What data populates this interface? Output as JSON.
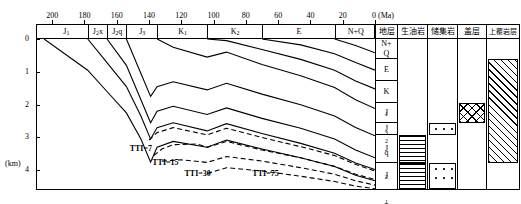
{
  "chart_data": {
    "type": "line",
    "xlabel": "Ma",
    "ylabel": "km",
    "xlim": [
      210,
      0
    ],
    "ylim": [
      0,
      4.6
    ],
    "x_axis": {
      "unit_label": "0 (Ma)",
      "unit_only": "(Ma)",
      "zero_label": "0",
      "ticks": [
        200,
        180,
        160,
        140,
        120,
        100,
        80,
        60,
        40,
        20,
        0
      ],
      "tick_labels": [
        "200",
        "180",
        "160",
        "140",
        "120",
        "100",
        "80",
        "60",
        "40",
        "20",
        "0"
      ],
      "direction": "decreasing-left-to-right"
    },
    "y_axis": {
      "unit_label": "(km)",
      "ticks": [
        0,
        1,
        2,
        3,
        4
      ],
      "tick_labels": [
        "0",
        "1",
        "2",
        "3",
        "4"
      ],
      "direction": "increasing-downward"
    },
    "grid": false,
    "legend": null,
    "top_stratigraphic_bar": [
      {
        "label": "J₁",
        "from_ma": 205,
        "to_ma": 178
      },
      {
        "label": "J₂x",
        "from_ma": 178,
        "to_ma": 166
      },
      {
        "label": "J₂q",
        "from_ma": 166,
        "to_ma": 154
      },
      {
        "label": "J₃",
        "from_ma": 154,
        "to_ma": 135
      },
      {
        "label": "K₁",
        "from_ma": 135,
        "to_ma": 104
      },
      {
        "label": "K₂",
        "from_ma": 104,
        "to_ma": 70
      },
      {
        "label": "E",
        "from_ma": 70,
        "to_ma": 25
      },
      {
        "label": "N+Q",
        "from_ma": 25,
        "to_ma": 0
      }
    ],
    "burial_curves": [
      {
        "name": "J₁-top",
        "points": [
          [
            205,
            0.0
          ],
          [
            178,
            0.95
          ],
          [
            166,
            1.6
          ],
          [
            154,
            2.25
          ],
          [
            145,
            3.05
          ],
          [
            139,
            3.75
          ],
          [
            135,
            3.3
          ],
          [
            125,
            3.12
          ],
          [
            104,
            3.3
          ],
          [
            92,
            3.08
          ],
          [
            70,
            3.35
          ],
          [
            46,
            3.62
          ],
          [
            25,
            3.88
          ],
          [
            12,
            4.15
          ],
          [
            0,
            4.32
          ]
        ]
      },
      {
        "name": "J₂x-top",
        "points": [
          [
            178,
            0.0
          ],
          [
            166,
            0.72
          ],
          [
            154,
            1.45
          ],
          [
            145,
            2.35
          ],
          [
            139,
            3.05
          ],
          [
            135,
            2.7
          ],
          [
            125,
            2.55
          ],
          [
            104,
            2.8
          ],
          [
            92,
            2.58
          ],
          [
            70,
            2.88
          ],
          [
            46,
            3.18
          ],
          [
            25,
            3.48
          ],
          [
            12,
            3.78
          ],
          [
            0,
            3.98
          ]
        ]
      },
      {
        "name": "J₂q-top",
        "points": [
          [
            166,
            0.0
          ],
          [
            154,
            0.8
          ],
          [
            145,
            1.85
          ],
          [
            139,
            2.55
          ],
          [
            135,
            2.2
          ],
          [
            125,
            2.05
          ],
          [
            104,
            2.3
          ],
          [
            92,
            2.1
          ],
          [
            70,
            2.42
          ],
          [
            46,
            2.72
          ],
          [
            25,
            3.05
          ],
          [
            12,
            3.38
          ],
          [
            0,
            3.62
          ]
        ]
      },
      {
        "name": "J₃-top",
        "points": [
          [
            154,
            0.0
          ],
          [
            145,
            1.05
          ],
          [
            139,
            1.75
          ],
          [
            135,
            1.45
          ],
          [
            125,
            1.3
          ],
          [
            104,
            1.55
          ],
          [
            92,
            1.35
          ],
          [
            70,
            1.68
          ],
          [
            46,
            2.0
          ],
          [
            25,
            2.35
          ],
          [
            12,
            2.7
          ],
          [
            0,
            2.95
          ]
        ]
      },
      {
        "name": "K₁-top",
        "points": [
          [
            135,
            0.0
          ],
          [
            125,
            0.25
          ],
          [
            104,
            0.55
          ],
          [
            92,
            0.4
          ],
          [
            70,
            0.78
          ],
          [
            46,
            1.12
          ],
          [
            25,
            1.48
          ],
          [
            12,
            1.85
          ],
          [
            0,
            2.12
          ]
        ]
      },
      {
        "name": "K₂-top",
        "points": [
          [
            104,
            0.0
          ],
          [
            92,
            0.05
          ],
          [
            70,
            0.32
          ],
          [
            46,
            0.62
          ],
          [
            25,
            0.95
          ],
          [
            12,
            1.28
          ],
          [
            0,
            1.52
          ]
        ]
      },
      {
        "name": "E-top",
        "points": [
          [
            70,
            0.0
          ],
          [
            46,
            0.18
          ],
          [
            25,
            0.45
          ],
          [
            12,
            0.72
          ],
          [
            0,
            0.95
          ]
        ]
      },
      {
        "name": "N+Q-top",
        "points": [
          [
            25,
            0.0
          ],
          [
            12,
            0.2
          ],
          [
            0,
            0.42
          ]
        ]
      }
    ],
    "tti_isolines": [
      {
        "label": "TTI=7",
        "value": 7,
        "label_ma": 152,
        "label_km": 3.2,
        "points": [
          [
            140,
            3.08
          ],
          [
            135,
            2.85
          ],
          [
            125,
            2.7
          ],
          [
            104,
            2.92
          ],
          [
            92,
            2.72
          ],
          [
            70,
            3.0
          ],
          [
            46,
            3.28
          ],
          [
            25,
            3.55
          ],
          [
            12,
            3.82
          ],
          [
            0,
            4.02
          ]
        ]
      },
      {
        "label": "TTI=15",
        "value": 15,
        "label_ma": 138,
        "label_km": 3.62,
        "points": [
          [
            137,
            3.55
          ],
          [
            132,
            3.35
          ],
          [
            125,
            3.22
          ],
          [
            110,
            3.2
          ],
          [
            104,
            3.3
          ],
          [
            92,
            3.12
          ],
          [
            70,
            3.38
          ],
          [
            46,
            3.62
          ],
          [
            25,
            3.88
          ],
          [
            12,
            4.12
          ],
          [
            0,
            4.28
          ]
        ]
      },
      {
        "label": "TTI=30",
        "value": 30,
        "label_ma": 118,
        "label_km": 3.95,
        "points": [
          [
            132,
            3.72
          ],
          [
            120,
            3.68
          ],
          [
            104,
            3.76
          ],
          [
            92,
            3.58
          ],
          [
            70,
            3.72
          ],
          [
            46,
            3.92
          ],
          [
            25,
            4.12
          ],
          [
            12,
            4.32
          ],
          [
            0,
            4.45
          ]
        ]
      },
      {
        "label": "TTI=75",
        "value": 75,
        "label_ma": 76,
        "label_km": 3.95,
        "points": [
          [
            104,
            4.1
          ],
          [
            92,
            3.92
          ],
          [
            70,
            4.02
          ],
          [
            46,
            4.18
          ],
          [
            25,
            4.34
          ],
          [
            12,
            4.48
          ],
          [
            0,
            4.56
          ]
        ]
      }
    ]
  },
  "right_panel": {
    "columns": [
      {
        "key": "strat",
        "label": "地层"
      },
      {
        "key": "source",
        "label": "生油岩"
      },
      {
        "key": "reservoir",
        "label": "储集岩"
      },
      {
        "key": "cap",
        "label": "盖层"
      },
      {
        "key": "overburden",
        "label": "上覆岩层"
      }
    ],
    "strat_rows": [
      {
        "label": "N+\nQ",
        "line1": "N+",
        "line2": "Q"
      },
      {
        "label": "E",
        "line1": "E",
        "line2": ""
      },
      {
        "label": "K₁",
        "line1": "K₁",
        "line2": ""
      },
      {
        "label": "J₃",
        "line1": "J₃",
        "line2": ""
      },
      {
        "label": "J₂q",
        "line1": "J₂q",
        "line2": ""
      },
      {
        "label": "J₂x",
        "line1": "J₂x",
        "line2": ""
      },
      {
        "label": "J₁",
        "line1": "J₁",
        "line2": ""
      }
    ],
    "source_rock_rows": [
      "J₂x",
      "J₁"
    ],
    "reservoir_rows": [
      "J₂q",
      "J₁"
    ],
    "cap_rock_rows": [
      "J₃"
    ],
    "overburden_rows": [
      "N+Q",
      "E",
      "K₁",
      "J₃",
      "J₂q",
      "J₂x"
    ]
  },
  "colors": {
    "line": "#000000",
    "background": "#ffffff"
  }
}
